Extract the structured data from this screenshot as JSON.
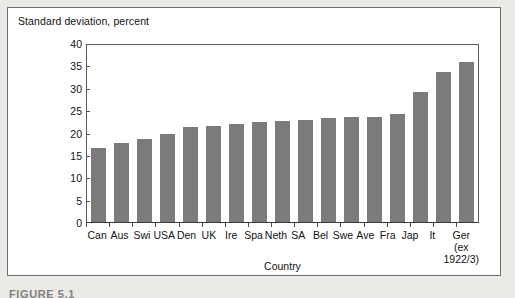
{
  "figure": {
    "caption": "FIGURE 5.1"
  },
  "chart_data": {
    "type": "bar",
    "title": "",
    "ylabel": "Standard deviation, percent",
    "xlabel": "Country",
    "ylim": [
      0,
      40
    ],
    "ytick_step": 5,
    "yticks": [
      0,
      5,
      10,
      15,
      20,
      25,
      30,
      35,
      40
    ],
    "ytick_labels": [
      "0",
      "5",
      "10",
      "15",
      "20",
      "25",
      "30",
      "35",
      "40"
    ],
    "grid": false,
    "legend": "none",
    "bar_color": "#7b7b7b",
    "categories": [
      "Can",
      "Aus",
      "Swi",
      "USA",
      "Den",
      "UK",
      "Ire",
      "Spa",
      "Neth",
      "SA",
      "Bel",
      "Swe",
      "Ave",
      "Fra",
      "Jap",
      "It",
      "Ger\n(ex\n1922/3)"
    ],
    "values": [
      16.7,
      17.9,
      18.8,
      19.9,
      21.4,
      21.7,
      22.2,
      22.7,
      22.8,
      23.1,
      23.6,
      23.7,
      23.7,
      24.5,
      29.3,
      34.0,
      36.2
    ]
  }
}
